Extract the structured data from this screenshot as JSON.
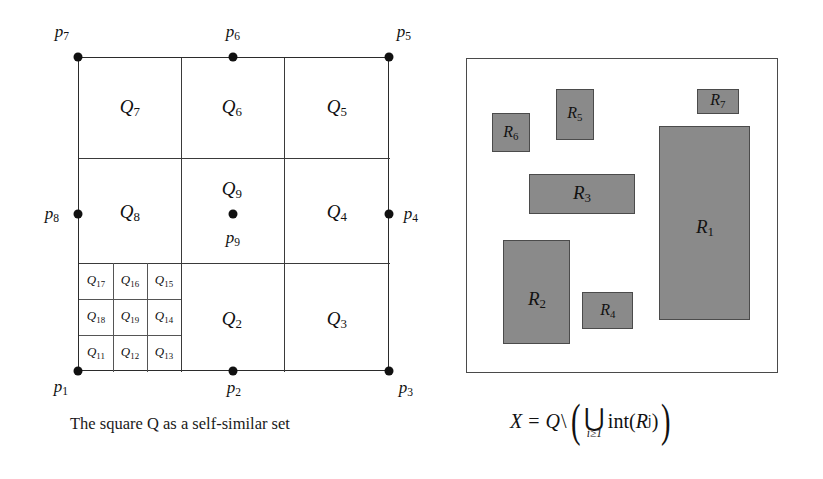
{
  "figure": {
    "left_panel": {
      "caption": "The square Q as a self-similar set",
      "square_label": "Q",
      "cells": [
        {
          "id": "Q7",
          "base": "Q",
          "sub": "7"
        },
        {
          "id": "Q6",
          "base": "Q",
          "sub": "6"
        },
        {
          "id": "Q5",
          "base": "Q",
          "sub": "5"
        },
        {
          "id": "Q8",
          "base": "Q",
          "sub": "8"
        },
        {
          "id": "Q9",
          "base": "Q",
          "sub": "9"
        },
        {
          "id": "Q4",
          "base": "Q",
          "sub": "4"
        },
        {
          "id": "Q2",
          "base": "Q",
          "sub": "2"
        },
        {
          "id": "Q3",
          "base": "Q",
          "sub": "3"
        },
        {
          "id": "Q17",
          "base": "Q",
          "sub": "17"
        },
        {
          "id": "Q16",
          "base": "Q",
          "sub": "16"
        },
        {
          "id": "Q15",
          "base": "Q",
          "sub": "15"
        },
        {
          "id": "Q18",
          "base": "Q",
          "sub": "18"
        },
        {
          "id": "Q19",
          "base": "Q",
          "sub": "19"
        },
        {
          "id": "Q14",
          "base": "Q",
          "sub": "14"
        },
        {
          "id": "Q11",
          "base": "Q",
          "sub": "11"
        },
        {
          "id": "Q12",
          "base": "Q",
          "sub": "12"
        },
        {
          "id": "Q13",
          "base": "Q",
          "sub": "13"
        }
      ],
      "points": [
        {
          "id": "p1",
          "base": "p",
          "sub": "1"
        },
        {
          "id": "p2",
          "base": "p",
          "sub": "2"
        },
        {
          "id": "p3",
          "base": "p",
          "sub": "3"
        },
        {
          "id": "p4",
          "base": "p",
          "sub": "4"
        },
        {
          "id": "p5",
          "base": "p",
          "sub": "5"
        },
        {
          "id": "p6",
          "base": "p",
          "sub": "6"
        },
        {
          "id": "p7",
          "base": "p",
          "sub": "7"
        },
        {
          "id": "p8",
          "base": "p",
          "sub": "8"
        },
        {
          "id": "p9",
          "base": "p",
          "sub": "9"
        }
      ]
    },
    "right_panel": {
      "rects": [
        {
          "id": "R1",
          "base": "R",
          "sub": "1"
        },
        {
          "id": "R2",
          "base": "R",
          "sub": "2"
        },
        {
          "id": "R3",
          "base": "R",
          "sub": "3"
        },
        {
          "id": "R4",
          "base": "R",
          "sub": "4"
        },
        {
          "id": "R5",
          "base": "R",
          "sub": "5"
        },
        {
          "id": "R6",
          "base": "R",
          "sub": "6"
        },
        {
          "id": "R7",
          "base": "R",
          "sub": "7"
        }
      ],
      "formula": {
        "lhs": "X",
        "equals": "=",
        "set": "Q",
        "setminus": "\\",
        "paren_open": "(",
        "paren_close": ")",
        "union_glyph": "⋃",
        "union_limit": "i≥1",
        "interior_op": "int",
        "interior_arg_open": "(",
        "interior_arg_base": "R",
        "interior_arg_sub": "j",
        "interior_arg_close": ")"
      }
    },
    "colors": {
      "rect_fill": "#8a8a8a",
      "rect_stroke": "#4b4b4b",
      "line": "#2b2b2b",
      "background": "#ffffff"
    }
  }
}
